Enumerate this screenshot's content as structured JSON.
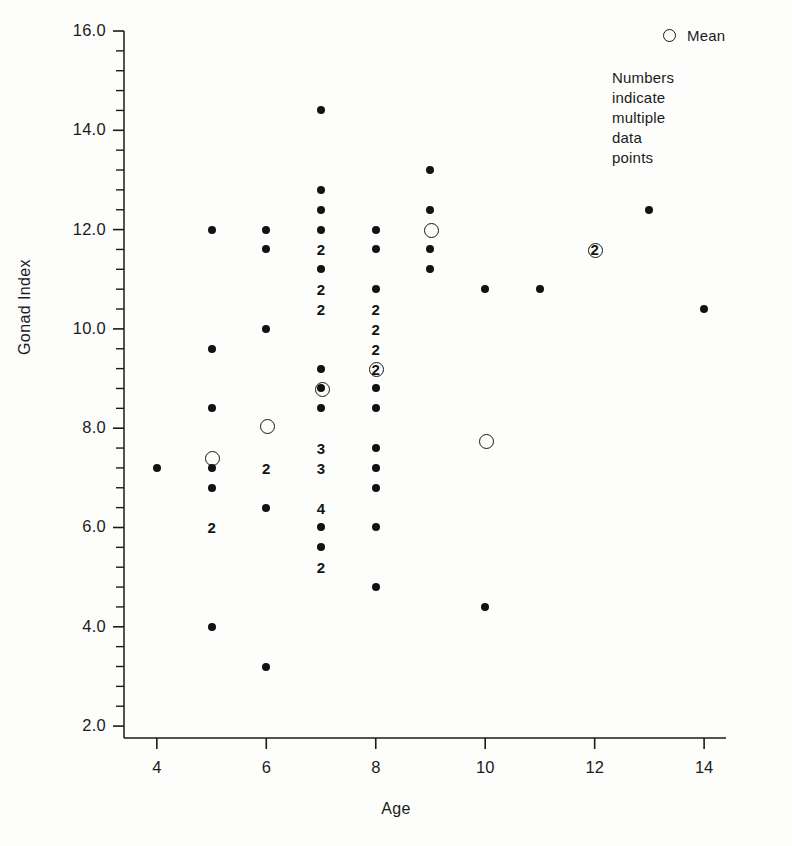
{
  "chart_data": {
    "type": "scatter",
    "title": "",
    "xlabel": "Age",
    "ylabel": "Gonad Index",
    "xlim": [
      3.4,
      14.4
    ],
    "ylim": [
      1.76,
      16.0
    ],
    "grid": false,
    "xticks": [
      4,
      6,
      8,
      10,
      12,
      14
    ],
    "xtick_labels": [
      "4",
      "6",
      "8",
      "10",
      "12",
      "14"
    ],
    "yticks": [
      2.0,
      4.0,
      6.0,
      8.0,
      10.0,
      12.0,
      14.0,
      16.0
    ],
    "ytick_labels": [
      "2.0",
      "4.0",
      "6.0",
      "8.0",
      "10.0",
      "12.0",
      "14.0",
      "16.0"
    ],
    "y_minor_tick_step": 0.4,
    "legend_position": "top-right",
    "legend": [
      {
        "marker": "open-circle",
        "label": "Mean"
      }
    ],
    "annotations": [
      "Numbers indicate\nmultiple data points"
    ],
    "marker_colors": {
      "data_point": "#121212",
      "mean": "#171717"
    },
    "series": [
      {
        "name": "Individual data points",
        "marker": "filled-circle",
        "points": [
          {
            "x": 4,
            "y": 7.2
          },
          {
            "x": 5,
            "y": 12.0
          },
          {
            "x": 5,
            "y": 9.6
          },
          {
            "x": 5,
            "y": 8.4
          },
          {
            "x": 5,
            "y": 7.2
          },
          {
            "x": 5,
            "y": 6.8
          },
          {
            "x": 5,
            "y": 4.0
          },
          {
            "x": 6,
            "y": 12.0
          },
          {
            "x": 6,
            "y": 11.6
          },
          {
            "x": 6,
            "y": 10.0
          },
          {
            "x": 6,
            "y": 6.4
          },
          {
            "x": 6,
            "y": 3.2
          },
          {
            "x": 7,
            "y": 14.4
          },
          {
            "x": 7,
            "y": 12.8
          },
          {
            "x": 7,
            "y": 12.4
          },
          {
            "x": 7,
            "y": 12.0
          },
          {
            "x": 7,
            "y": 11.2
          },
          {
            "x": 7,
            "y": 9.2
          },
          {
            "x": 7,
            "y": 8.8
          },
          {
            "x": 7,
            "y": 8.4
          },
          {
            "x": 7,
            "y": 6.0
          },
          {
            "x": 7,
            "y": 5.6
          },
          {
            "x": 8,
            "y": 12.0
          },
          {
            "x": 8,
            "y": 11.6
          },
          {
            "x": 8,
            "y": 10.8
          },
          {
            "x": 8,
            "y": 8.8
          },
          {
            "x": 8,
            "y": 8.4
          },
          {
            "x": 8,
            "y": 7.6
          },
          {
            "x": 8,
            "y": 7.2
          },
          {
            "x": 8,
            "y": 6.8
          },
          {
            "x": 8,
            "y": 6.0
          },
          {
            "x": 8,
            "y": 4.8
          },
          {
            "x": 9,
            "y": 13.2
          },
          {
            "x": 9,
            "y": 12.4
          },
          {
            "x": 9,
            "y": 11.6
          },
          {
            "x": 9,
            "y": 11.2
          },
          {
            "x": 10,
            "y": 10.8
          },
          {
            "x": 10,
            "y": 4.4
          },
          {
            "x": 11,
            "y": 10.8
          },
          {
            "x": 13,
            "y": 12.4
          },
          {
            "x": 14,
            "y": 10.4
          }
        ]
      },
      {
        "name": "Mean",
        "marker": "open-circle",
        "points": [
          {
            "x": 5,
            "y": 7.4
          },
          {
            "x": 6,
            "y": 8.05
          },
          {
            "x": 7,
            "y": 8.8
          },
          {
            "x": 8,
            "y": 9.2
          },
          {
            "x": 9,
            "y": 12.0
          },
          {
            "x": 10,
            "y": 7.75
          },
          {
            "x": 12,
            "y": 11.6
          }
        ]
      },
      {
        "name": "Multiple data points (count labels)",
        "marker": "numeral",
        "points": [
          {
            "x": 5,
            "y": 6.0,
            "count": 2
          },
          {
            "x": 6,
            "y": 7.2,
            "count": 2
          },
          {
            "x": 7,
            "y": 11.6,
            "count": 2
          },
          {
            "x": 7,
            "y": 10.8,
            "count": 2
          },
          {
            "x": 7,
            "y": 10.4,
            "count": 2
          },
          {
            "x": 7,
            "y": 7.6,
            "count": 3
          },
          {
            "x": 7,
            "y": 7.2,
            "count": 3
          },
          {
            "x": 7,
            "y": 6.4,
            "count": 4
          },
          {
            "x": 7,
            "y": 5.2,
            "count": 2
          },
          {
            "x": 8,
            "y": 10.4,
            "count": 2
          },
          {
            "x": 8,
            "y": 10.0,
            "count": 2
          },
          {
            "x": 8,
            "y": 9.6,
            "count": 2
          },
          {
            "x": 8,
            "y": 9.2,
            "count": 2
          },
          {
            "x": 12,
            "y": 11.6,
            "count": 2
          }
        ]
      }
    ]
  },
  "legend": {
    "mean_label": "Mean",
    "note": "Numbers indicate\nmultiple data points"
  },
  "axes": {
    "x_title": "Age",
    "y_title": "Gonad Index"
  }
}
